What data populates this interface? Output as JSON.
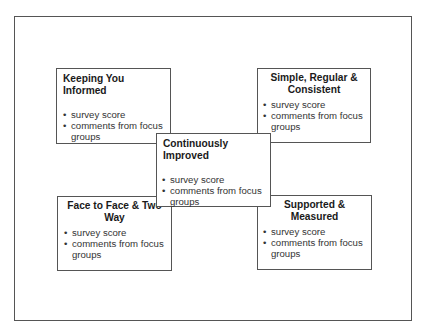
{
  "diagram": {
    "boxes": {
      "keeping": {
        "title": "Keeping You Informed",
        "items": [
          "survey score",
          "comments from focus groups"
        ]
      },
      "simple": {
        "title": "Simple, Regular & Consistent",
        "items": [
          "survey score",
          "comments from focus groups"
        ]
      },
      "central": {
        "title": "Continuously Improved",
        "items": [
          "survey score",
          "comments from focus groups"
        ]
      },
      "face": {
        "title": "Face to Face & Two Way",
        "items": [
          "survey score",
          "comments from focus groups"
        ]
      },
      "supported": {
        "title": "Supported & Measured",
        "items": [
          "survey score",
          "comments from focus groups"
        ]
      }
    },
    "bullet_glyph": "•",
    "colors": {
      "border": "#555555",
      "text": "#222222",
      "background": "#ffffff"
    }
  }
}
